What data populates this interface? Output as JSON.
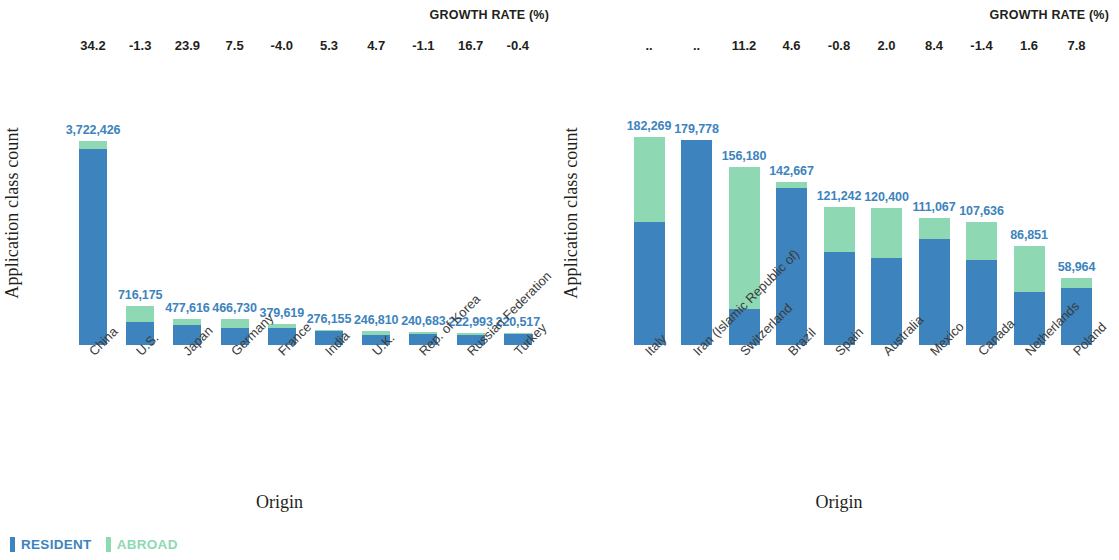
{
  "legend": {
    "resident_label": "RESIDENT",
    "abroad_label": "ABROAD",
    "resident_color": "#3d83bd",
    "abroad_color": "#8ed9b3"
  },
  "growth_header": "GROWTH RATE (%)",
  "axis": {
    "y_title": "Application class count",
    "x_title": "Origin"
  },
  "chart_data": [
    {
      "type": "bar",
      "subtype": "stacked-vertical",
      "panel": "left",
      "title": "",
      "xlabel": "Origin",
      "ylabel": "Application class count",
      "legend": [
        "RESIDENT",
        "ABROAD"
      ],
      "legend_position": "bottom-left",
      "grid": false,
      "ylim": [
        0,
        3722426
      ],
      "categories": [
        "China",
        "U.S.",
        "Japan",
        "Germany",
        "France",
        "India",
        "U.K.",
        "Rep. of Korea",
        "Russian Federation",
        "Turkey"
      ],
      "totals": [
        3722426,
        716175,
        477616,
        466730,
        379619,
        276155,
        246810,
        240683,
        222993,
        220517
      ],
      "total_labels": [
        "3,722,426",
        "716,175",
        "477,616",
        "466,730",
        "379,619",
        "276,155",
        "246,810",
        "240,683",
        "222,993",
        "220,517"
      ],
      "growth_rate_labels": [
        "34.2",
        "-1.3",
        "23.9",
        "7.5",
        "-4.0",
        "5.3",
        "4.7",
        "-1.1",
        "16.7",
        "-0.4"
      ],
      "growth_rate_values": [
        34.2,
        -1.3,
        23.9,
        7.5,
        -4.0,
        5.3,
        4.7,
        -1.1,
        16.7,
        -0.4
      ],
      "series": [
        {
          "name": "RESIDENT",
          "color": "#3d83bd",
          "values": [
            3573528,
            415382,
            372540,
            303373,
            311288,
            252482,
            179339,
            209394,
            189544,
            200670
          ],
          "fractions": [
            0.96,
            0.58,
            0.78,
            0.65,
            0.82,
            0.914,
            0.727,
            0.87,
            0.85,
            0.91
          ]
        },
        {
          "name": "ABROAD",
          "color": "#8ed9b3",
          "values": [
            148898,
            300793,
            105076,
            163357,
            68331,
            23673,
            67471,
            31289,
            33449,
            19847
          ],
          "fractions": [
            0.04,
            0.42,
            0.22,
            0.35,
            0.18,
            0.086,
            0.273,
            0.13,
            0.15,
            0.09
          ]
        }
      ]
    },
    {
      "type": "bar",
      "subtype": "stacked-vertical",
      "panel": "right",
      "title": "",
      "xlabel": "Origin",
      "ylabel": "Application class count",
      "legend": [
        "RESIDENT",
        "ABROAD"
      ],
      "legend_position": "bottom-left",
      "grid": false,
      "ylim": [
        0,
        182269
      ],
      "categories": [
        "Italy",
        "Iran (Islamic Republic of)",
        "Switzerland",
        "Brazil",
        "Spain",
        "Australia",
        "Mexico",
        "Canada",
        "Netherlands",
        "Poland"
      ],
      "totals": [
        182269,
        179778,
        156180,
        142667,
        121242,
        120400,
        111067,
        107636,
        86851,
        58964
      ],
      "total_labels": [
        "182,269",
        "179,778",
        "156,180",
        "142,667",
        "121,242",
        "120,400",
        "111,067",
        "107,636",
        "86,851",
        "58,964"
      ],
      "growth_rate_labels": [
        "..",
        "..",
        "11.2",
        "4.6",
        "-0.8",
        "2.0",
        "8.4",
        "-1.4",
        "1.6",
        "7.8"
      ],
      "growth_rate_values": [
        null,
        null,
        11.2,
        4.6,
        -0.8,
        2.0,
        8.4,
        -1.4,
        1.6,
        7.8
      ],
      "series": [
        {
          "name": "RESIDENT",
          "color": "#3d83bd",
          "values": [
            107539,
            179778,
            31236,
            137760,
            81232,
            76332,
            93296,
            74269,
            46099,
            50119
          ],
          "fractions": [
            0.59,
            1.0,
            0.2,
            0.966,
            0.67,
            0.634,
            0.84,
            0.69,
            0.531,
            0.85
          ]
        },
        {
          "name": "ABROAD",
          "color": "#8ed9b3",
          "values": [
            74730,
            0,
            124944,
            4907,
            40010,
            44068,
            17771,
            33367,
            40752,
            8845
          ],
          "fractions": [
            0.41,
            0.0,
            0.8,
            0.034,
            0.33,
            0.366,
            0.16,
            0.31,
            0.469,
            0.15
          ]
        }
      ]
    }
  ]
}
